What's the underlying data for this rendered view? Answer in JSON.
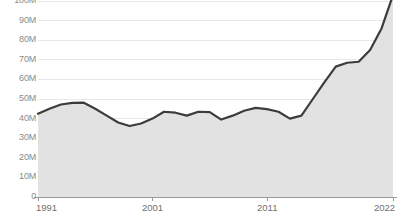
{
  "chart_data": {
    "type": "area",
    "title": "",
    "subtitle": "",
    "xlabel": "",
    "ylabel": "",
    "xlim": [
      1991,
      2022
    ],
    "ylim": [
      0,
      100000000
    ],
    "grid": true,
    "legend": null,
    "y_ticks": [
      {
        "value": 0,
        "label": "0"
      },
      {
        "value": 10000000,
        "label": "10M"
      },
      {
        "value": 20000000,
        "label": "20M"
      },
      {
        "value": 30000000,
        "label": "30M"
      },
      {
        "value": 40000000,
        "label": "40M"
      },
      {
        "value": 50000000,
        "label": "50M"
      },
      {
        "value": 60000000,
        "label": "60M"
      },
      {
        "value": 70000000,
        "label": "70M"
      },
      {
        "value": 80000000,
        "label": "80M"
      },
      {
        "value": 90000000,
        "label": "90M"
      },
      {
        "value": 100000000,
        "label": "100M"
      }
    ],
    "x_ticks": [
      {
        "value": 1991,
        "label": "1991"
      },
      {
        "value": 2001,
        "label": "2001"
      },
      {
        "value": 2011,
        "label": "2011"
      },
      {
        "value": 2022,
        "label": "2022"
      }
    ],
    "x": [
      1991,
      1992,
      1993,
      1994,
      1995,
      1996,
      1997,
      1998,
      1999,
      2000,
      2001,
      2002,
      2003,
      2004,
      2005,
      2006,
      2007,
      2008,
      2009,
      2010,
      2011,
      2012,
      2013,
      2014,
      2015,
      2016,
      2017,
      2018,
      2019,
      2020,
      2021,
      2022
    ],
    "series": [
      {
        "name": "Value",
        "line_color": "#3c3c3c",
        "fill_color": "#e2e2e2",
        "values": [
          42500000,
          45000000,
          47200000,
          48000000,
          48100000,
          45000000,
          41500000,
          38000000,
          36200000,
          37500000,
          40000000,
          43500000,
          43000000,
          41500000,
          43500000,
          43300000,
          39500000,
          41500000,
          44000000,
          45500000,
          44800000,
          43500000,
          40000000,
          41500000,
          50000000,
          58500000,
          66500000,
          68500000,
          69000000,
          75000000,
          86000000,
          103000000
        ]
      }
    ]
  },
  "axis": {
    "axis_line_color": "#9a9a9a",
    "gridline_color": "#e8e8e8",
    "tick_label_color": "#8a8a8a"
  }
}
